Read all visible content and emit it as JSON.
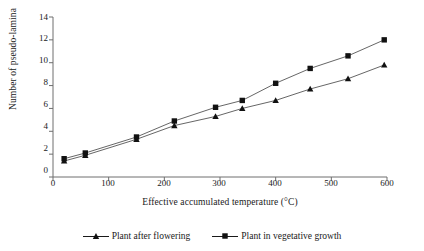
{
  "chart_data": {
    "type": "line",
    "title": "",
    "xlabel": "Effective accumulated temperature (°C)",
    "ylabel": "Number of pseudo-lamina",
    "xlim": [
      0,
      600
    ],
    "ylim": [
      0,
      14
    ],
    "xticks": [
      0,
      100,
      200,
      300,
      400,
      500,
      600
    ],
    "yticks": [
      0,
      2,
      4,
      6,
      8,
      10,
      12,
      14
    ],
    "grid": false,
    "legend_position": "bottom",
    "series": [
      {
        "name": "Plant after flowering",
        "marker": "triangle",
        "x": [
          20,
          58,
          150,
          218,
          292,
          340,
          400,
          462,
          530,
          595
        ],
        "y": [
          1.4,
          1.9,
          3.3,
          4.5,
          5.3,
          6.0,
          6.7,
          7.7,
          8.6,
          9.8
        ]
      },
      {
        "name": "Plant in vegetative growth",
        "marker": "square",
        "x": [
          20,
          58,
          150,
          218,
          292,
          340,
          400,
          462,
          530,
          595
        ],
        "y": [
          1.6,
          2.1,
          3.5,
          4.9,
          6.1,
          6.7,
          8.2,
          9.5,
          10.6,
          12.0
        ]
      }
    ]
  },
  "legend": {
    "items": [
      {
        "label": "Plant after flowering",
        "marker": "triangle-marker"
      },
      {
        "label": "Plant in vegetative growth",
        "marker": "square-marker"
      }
    ]
  },
  "axis": {
    "y_tick_labels": [
      "14",
      "12",
      "10",
      "8",
      "6",
      "4",
      "2",
      "0"
    ],
    "x_tick_labels": [
      "0",
      "100",
      "200",
      "300",
      "400",
      "500",
      "600"
    ],
    "y_title": "Number of pseudo-lamina",
    "x_title": "Effective accumulated temperature (°C)"
  },
  "colors": {
    "axis": "#6e6e6e",
    "marker": "#111111",
    "line": "#555555",
    "text": "#1a1a1a",
    "background": "#ffffff"
  }
}
